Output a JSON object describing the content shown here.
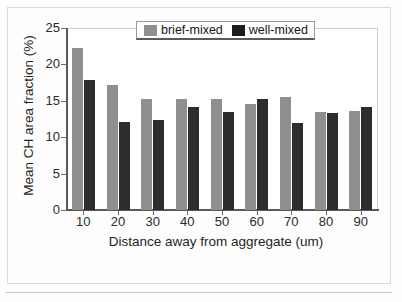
{
  "chart_data": {
    "type": "bar",
    "title": "",
    "xlabel": "Distance away from aggregate (um)",
    "ylabel": "Mean CH area fraction (%)",
    "categories": [
      "10",
      "20",
      "30",
      "40",
      "50",
      "60",
      "70",
      "80",
      "90"
    ],
    "series": [
      {
        "name": "brief-mixed",
        "color": "#8f8f8f",
        "values": [
          22.3,
          17.2,
          15.2,
          15.2,
          15.2,
          14.6,
          15.5,
          13.5,
          13.6
        ]
      },
      {
        "name": "well-mixed",
        "color": "#2d2d2d",
        "values": [
          17.9,
          12.1,
          12.4,
          14.2,
          13.4,
          15.3,
          11.9,
          13.3,
          14.1
        ]
      }
    ],
    "ylim": [
      0,
      25
    ],
    "yticks": [
      0,
      5,
      10,
      15,
      20,
      25
    ],
    "ytick_labels": [
      "0",
      "5",
      "10",
      "15",
      "20",
      "25"
    ],
    "grid": false,
    "legend_position": "top-center"
  },
  "legend": {
    "entries": [
      {
        "label": "brief-mixed"
      },
      {
        "label": "well-mixed"
      }
    ]
  }
}
